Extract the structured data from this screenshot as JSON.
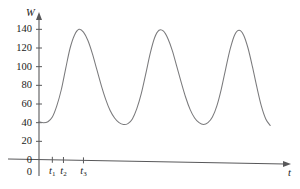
{
  "chart_data": {
    "type": "line",
    "title": "",
    "xlabel": "t",
    "ylabel": "W",
    "ylim": [
      0,
      150
    ],
    "xlim": [
      0,
      100
    ],
    "grid": false,
    "legend": null,
    "y_ticks": [
      {
        "value": 140,
        "label": "140"
      },
      {
        "value": 120,
        "label": "120"
      },
      {
        "value": 100,
        "label": "100"
      },
      {
        "value": 80,
        "label": "80"
      },
      {
        "value": 60,
        "label": "60"
      },
      {
        "value": 40,
        "label": "40"
      },
      {
        "value": 20,
        "label": "20"
      },
      {
        "value": 0,
        "label": "0"
      }
    ],
    "x_ticks": [
      {
        "value": 6.0,
        "label": "t",
        "sub": "1"
      },
      {
        "value": 11.0,
        "label": "t",
        "sub": "2"
      },
      {
        "value": 20.0,
        "label": "t",
        "sub": "3"
      }
    ],
    "series": [
      {
        "name": "W(t)",
        "color": "#7a7a7c",
        "points": [
          {
            "x": 0.0,
            "y": 41
          },
          {
            "x": 2.0,
            "y": 40
          },
          {
            "x": 4.0,
            "y": 41
          },
          {
            "x": 6.0,
            "y": 46
          },
          {
            "x": 8.0,
            "y": 58
          },
          {
            "x": 10.0,
            "y": 75
          },
          {
            "x": 12.0,
            "y": 98
          },
          {
            "x": 14.0,
            "y": 120
          },
          {
            "x": 16.0,
            "y": 134
          },
          {
            "x": 18.0,
            "y": 140
          },
          {
            "x": 20.0,
            "y": 137
          },
          {
            "x": 22.0,
            "y": 128
          },
          {
            "x": 24.0,
            "y": 114
          },
          {
            "x": 26.0,
            "y": 97
          },
          {
            "x": 28.0,
            "y": 80
          },
          {
            "x": 30.0,
            "y": 65
          },
          {
            "x": 32.0,
            "y": 53
          },
          {
            "x": 34.0,
            "y": 45
          },
          {
            "x": 36.0,
            "y": 40
          },
          {
            "x": 38.0,
            "y": 38
          },
          {
            "x": 40.0,
            "y": 39
          },
          {
            "x": 42.0,
            "y": 44
          },
          {
            "x": 44.0,
            "y": 55
          },
          {
            "x": 46.0,
            "y": 71
          },
          {
            "x": 48.0,
            "y": 92
          },
          {
            "x": 50.0,
            "y": 114
          },
          {
            "x": 52.0,
            "y": 131
          },
          {
            "x": 54.0,
            "y": 139
          },
          {
            "x": 56.0,
            "y": 138
          },
          {
            "x": 58.0,
            "y": 130
          },
          {
            "x": 60.0,
            "y": 117
          },
          {
            "x": 62.0,
            "y": 100
          },
          {
            "x": 64.0,
            "y": 83
          },
          {
            "x": 66.0,
            "y": 67
          },
          {
            "x": 68.0,
            "y": 54
          },
          {
            "x": 70.0,
            "y": 45
          },
          {
            "x": 72.0,
            "y": 40
          },
          {
            "x": 74.0,
            "y": 38
          },
          {
            "x": 76.0,
            "y": 40
          },
          {
            "x": 78.0,
            "y": 46
          },
          {
            "x": 80.0,
            "y": 58
          },
          {
            "x": 82.0,
            "y": 76
          },
          {
            "x": 84.0,
            "y": 98
          },
          {
            "x": 86.0,
            "y": 119
          },
          {
            "x": 88.0,
            "y": 134
          },
          {
            "x": 90.0,
            "y": 139
          },
          {
            "x": 92.0,
            "y": 134
          },
          {
            "x": 94.0,
            "y": 120
          },
          {
            "x": 96.0,
            "y": 100
          },
          {
            "x": 98.0,
            "y": 78
          },
          {
            "x": 100.0,
            "y": 58
          },
          {
            "x": 102.0,
            "y": 44
          },
          {
            "x": 104.0,
            "y": 37
          }
        ]
      }
    ]
  }
}
